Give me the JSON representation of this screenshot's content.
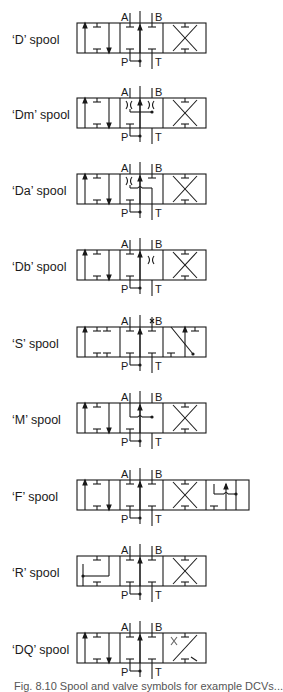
{
  "figure": {
    "ports": {
      "a": "A",
      "b": "B",
      "p": "P",
      "t": "T"
    },
    "spools": [
      {
        "id": "D",
        "label": "‘D’ spool"
      },
      {
        "id": "Dm",
        "label": "‘Dm’ spool"
      },
      {
        "id": "Da",
        "label": "‘Da’ spool"
      },
      {
        "id": "Db",
        "label": "‘Db’ spool"
      },
      {
        "id": "S",
        "label": "‘S’ spool"
      },
      {
        "id": "M",
        "label": "‘M’ spool"
      },
      {
        "id": "F",
        "label": "‘F’ spool"
      },
      {
        "id": "R",
        "label": "‘R’ spool"
      },
      {
        "id": "DQ",
        "label": "‘DQ’ spool"
      }
    ],
    "caption": "Fig. 8.10  Spool and valve symbols for example DCVs..."
  }
}
